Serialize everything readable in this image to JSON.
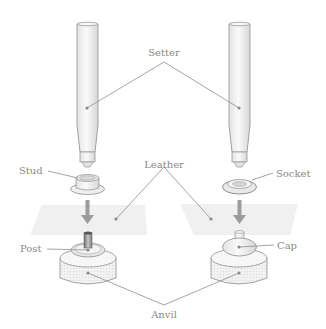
{
  "diagram": {
    "type": "snap-fastener setting diagram",
    "colors": {
      "outline": "#9a9a9a",
      "label": "#8a8a8a",
      "arrow": "#9c9c9c",
      "leather": "#efefef",
      "metal_light": "#f4f4f4",
      "metal_dark": "#cfcfcf"
    },
    "labels": {
      "setter": "Setter",
      "leather": "Leather",
      "stud": "Stud",
      "socket": "Socket",
      "post": "Post",
      "cap": "Cap",
      "anvil": "Anvil"
    },
    "left_assembly": {
      "parts": [
        "Setter",
        "Stud",
        "Leather",
        "Post",
        "Anvil"
      ]
    },
    "right_assembly": {
      "parts": [
        "Setter",
        "Socket",
        "Leather",
        "Cap",
        "Anvil"
      ]
    }
  }
}
